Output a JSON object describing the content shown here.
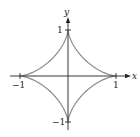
{
  "chart_data": {
    "type": "line",
    "title": "",
    "xlabel": "x",
    "ylabel": "y",
    "xlim": [
      -1,
      1
    ],
    "ylim": [
      -1,
      1
    ],
    "grid": false,
    "legend": null,
    "curve": "astroid",
    "equation": "x^(2/3) + y^(2/3) = 1",
    "parametric": {
      "x": "cos^3(t)",
      "y": "sin^3(t)",
      "t_range": [
        0,
        6.2832
      ]
    },
    "x_ticks": [
      "-1",
      "1"
    ],
    "y_ticks": [
      "1",
      "-1"
    ],
    "series": [
      {
        "name": "astroid",
        "color": "#8a8a8a",
        "points": [
          [
            1,
            0
          ],
          [
            0.3536,
            0.3536
          ],
          [
            0,
            1
          ],
          [
            -0.3536,
            0.3536
          ],
          [
            -1,
            0
          ],
          [
            -0.3536,
            -0.3536
          ],
          [
            0,
            -1
          ],
          [
            0.3536,
            -0.3536
          ],
          [
            1,
            0
          ]
        ]
      }
    ],
    "axis_color": "#222222"
  },
  "labels": {
    "x_axis": "x",
    "y_axis": "y",
    "x_neg": "−1",
    "x_pos": "1",
    "y_pos": "1",
    "y_neg": "−1"
  }
}
